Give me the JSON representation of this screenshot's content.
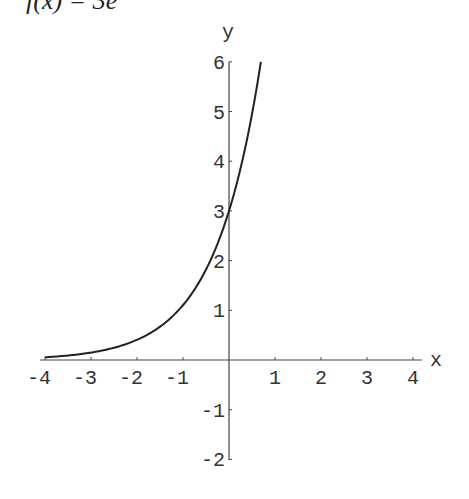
{
  "title": "f(x) = 3e",
  "chart_data": {
    "type": "line",
    "xlabel": "x",
    "ylabel": "y",
    "xlim": [
      -4,
      4
    ],
    "ylim": [
      -2,
      6
    ],
    "x_ticks": [
      -4,
      -3,
      -2,
      -1,
      1,
      2,
      3,
      4
    ],
    "y_ticks": [
      -2,
      -1,
      1,
      2,
      3,
      4,
      5,
      6
    ],
    "grid": false,
    "series": [
      {
        "name": "f(x) = 3e^x",
        "x": [
          -4,
          -3.5,
          -3,
          -2.5,
          -2,
          -1.5,
          -1,
          -0.5,
          0,
          0.25,
          0.5,
          0.693
        ],
        "y": [
          0.055,
          0.091,
          0.149,
          0.246,
          0.406,
          0.669,
          1.104,
          1.82,
          3.0,
          3.852,
          4.946,
          6.0
        ]
      }
    ]
  }
}
